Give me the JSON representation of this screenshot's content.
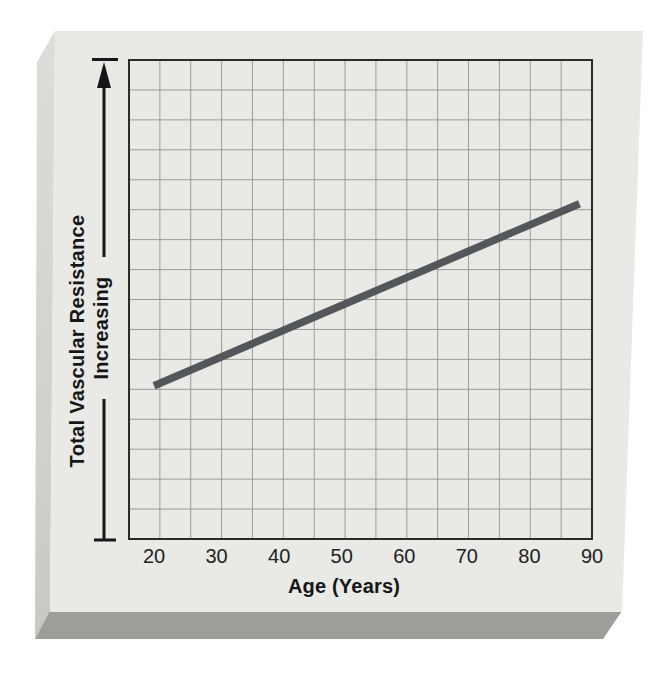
{
  "figure": {
    "y_axis_label_line1": "Total Vascular Resistance",
    "y_axis_label_line2": "Increasing",
    "x_axis_label": "Age (Years)"
  },
  "colors": {
    "page_background": "#ffffff",
    "card_face": "#e9e9e5",
    "card_left_edge": "#d4d5d1",
    "card_bottom_edge": "#9d9e9a",
    "grid_line": "#9b9b99",
    "plot_border": "#2b2b2b",
    "data_line": "#53565a",
    "text": "#161616"
  },
  "chart_data": {
    "type": "line",
    "title": "",
    "xlabel": "Age (Years)",
    "ylabel": "Total Vascular Resistance — Increasing (qualitative axis with up arrow)",
    "x_ticks": [
      20,
      30,
      40,
      50,
      60,
      70,
      80,
      90
    ],
    "xlim": [
      16,
      90
    ],
    "ylim": [
      0,
      1
    ],
    "y_axis_note": "unlabeled qualitative axis; vertical double-capped arrow indicates increasing direction",
    "grid": true,
    "legend": "none",
    "grid_cols": 15,
    "grid_rows": 16,
    "series": [
      {
        "name": "Total vascular resistance vs age",
        "x": [
          20,
          88
        ],
        "y_fraction": [
          0.32,
          0.7
        ],
        "shape": "single straight increasing line"
      }
    ]
  }
}
